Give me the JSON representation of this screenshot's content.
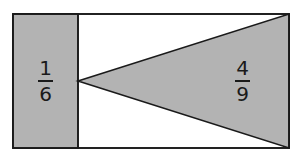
{
  "figure": {
    "background_color": "#ffffff",
    "shaded_fill_color": "#b3b3b3",
    "outline_color": "#1a1a1a",
    "outline_width": 1.6
  },
  "outer_rectangle": {
    "name": "outer-rectangle",
    "x": 13,
    "y": 14,
    "width": 276,
    "height": 134,
    "fill": "#ffffff",
    "stroke": "#1a1a1a"
  },
  "shaded_rectangle": {
    "name": "left-shaded-rectangle",
    "x": 13,
    "y": 14,
    "width": 65,
    "height": 134,
    "fill": "#b3b3b3",
    "stroke": "#1a1a1a",
    "label": {
      "numerator": "1",
      "denominator": "6",
      "text": "1/6"
    }
  },
  "divider_line": {
    "name": "vertical-divider",
    "x": 78,
    "y1": 14,
    "y2": 148,
    "stroke": "#1a1a1a"
  },
  "shaded_triangle": {
    "name": "shaded-triangle",
    "points": "78,81 289,14 289,148",
    "apex": {
      "x": 78,
      "y": 81
    },
    "top_vertex": {
      "x": 289,
      "y": 14
    },
    "bottom_vertex": {
      "x": 289,
      "y": 148
    },
    "fill": "#b3b3b3",
    "stroke": "#1a1a1a",
    "label": {
      "numerator": "4",
      "denominator": "9",
      "text": "4/9"
    }
  }
}
